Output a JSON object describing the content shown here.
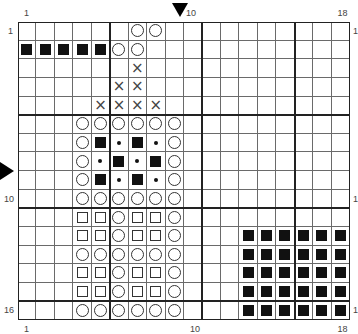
{
  "chart_data": {
    "type": "table",
    "title": "",
    "columns": 18,
    "rows": 16,
    "top_labels": [
      {
        "col": 1,
        "text": "1"
      },
      {
        "col": 10,
        "text": "10"
      },
      {
        "col": 18,
        "text": "18"
      }
    ],
    "bottom_labels": [
      {
        "col": 1,
        "text": "1"
      },
      {
        "col": 10,
        "text": "10"
      },
      {
        "col": 18,
        "text": "18"
      }
    ],
    "left_labels": [
      {
        "row": 1,
        "text": "1"
      },
      {
        "row": 10,
        "text": "10"
      },
      {
        "row": 16,
        "text": "16"
      }
    ],
    "right_labels": [
      {
        "row": 1,
        "text": "1"
      },
      {
        "row": 10,
        "text": "1"
      },
      {
        "row": 16,
        "text": "1"
      }
    ],
    "markers": {
      "top_arrow_col": 10,
      "left_arrow_row": 8
    },
    "thick_lines_after_col": [
      5,
      10,
      15
    ],
    "thick_lines_after_row": [
      5,
      10,
      15
    ],
    "legend_symbols": {
      "F": "filled-square",
      "S": "open-square",
      "O": "open-circle",
      "D": "dot",
      "X": "cross",
      ".": "empty"
    },
    "grid": [
      "......OO..........",
      "FFFFFOO...........",
      "......X...........",
      ".....XX...........",
      "....XXXX..........",
      "...OOOOOO.........",
      "...OFDFDO.........",
      "...ODFDFO.........",
      "...OFDFDO.........",
      "...OOOOOO.........",
      "...SSOSSO.........",
      "...SSOSSO...FFFFFF",
      "...OOOOOO...FFFFFF",
      "...SSOSSO...FFFFFF",
      "...SSOSSO...FFFFFF",
      "...OOOOOO...FFFFFF"
    ]
  },
  "symbols": {
    "cross_glyph": "×"
  }
}
